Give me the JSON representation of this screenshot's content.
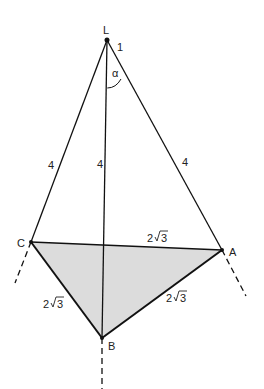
{
  "figure": {
    "type": "geometry-diagram",
    "points": {
      "L": {
        "label": "L",
        "x": 107,
        "y": 40
      },
      "C": {
        "label": "C",
        "x": 31,
        "y": 242
      },
      "A": {
        "label": "A",
        "x": 222,
        "y": 250
      },
      "B": {
        "label": "B",
        "x": 102,
        "y": 338
      }
    },
    "edge_labels": {
      "LC": "4",
      "LB": "4",
      "LA": "4",
      "CA": "2√3",
      "CB": "2√3",
      "BA": "2√3"
    },
    "edge_label_parts": {
      "coef": "2",
      "radicand": "3"
    },
    "annotations": {
      "unit_mark": "1",
      "angle": "α"
    },
    "colors": {
      "line": "#111111",
      "base_fill": "#d9d9d9"
    }
  }
}
